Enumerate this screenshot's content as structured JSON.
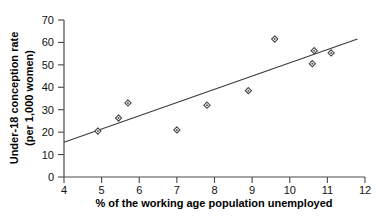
{
  "chart_data": {
    "type": "scatter",
    "title": "",
    "xlabel": "% of the working age population unemployed",
    "ylabel": "Under-18 conception rate (per 1,000 women)",
    "ylabel_line1": "Under-18 conception rate",
    "ylabel_line2": "(per 1,000 women)",
    "xlim": [
      4,
      12
    ],
    "ylim": [
      0,
      70
    ],
    "xticks": [
      4,
      5,
      6,
      7,
      8,
      9,
      10,
      11,
      12
    ],
    "yticks": [
      0,
      10,
      20,
      30,
      40,
      50,
      60,
      70
    ],
    "xtick_labels": [
      "4",
      "5",
      "6",
      "7",
      "8",
      "9",
      "10",
      "11",
      "12"
    ],
    "ytick_labels": [
      "0",
      "10",
      "20",
      "30",
      "40",
      "50",
      "60",
      "70"
    ],
    "grid": false,
    "legend": false,
    "marker_shape": "diamond-open",
    "marker_color": "#444444",
    "line_color": "#3a3a3a",
    "points": [
      {
        "x": 4.9,
        "y": 20.5
      },
      {
        "x": 5.45,
        "y": 26.3
      },
      {
        "x": 5.7,
        "y": 33.0
      },
      {
        "x": 7.0,
        "y": 21.0
      },
      {
        "x": 7.8,
        "y": 32.0
      },
      {
        "x": 8.9,
        "y": 38.5
      },
      {
        "x": 9.6,
        "y": 61.5
      },
      {
        "x": 10.6,
        "y": 50.5
      },
      {
        "x": 10.65,
        "y": 56.3
      },
      {
        "x": 11.1,
        "y": 55.3
      }
    ],
    "trendline": {
      "type": "linear",
      "x_start": 4.0,
      "y_start": 15.5,
      "x_end": 11.8,
      "y_end": 61.5
    }
  }
}
